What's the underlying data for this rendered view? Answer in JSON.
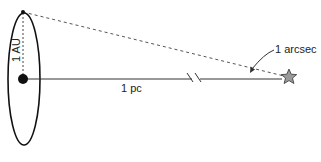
{
  "diagram": {
    "labels": {
      "au": "1 AU",
      "pc": "1 pc",
      "angle": "1 arcsec"
    },
    "elements": {
      "orbit": "Earth orbit (ellipse)",
      "sun": "Sun",
      "earth": "Earth position",
      "star": "Star",
      "baseline": "Sun-to-star distance line (with break)",
      "sightline": "Dashed line from Earth to star"
    },
    "colors": {
      "stroke": "#111111",
      "dashed": "#555555",
      "star_fill": "#9a9a9a"
    }
  }
}
